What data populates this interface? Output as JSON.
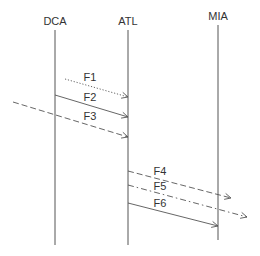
{
  "diagram": {
    "type": "sequence",
    "colors": {
      "line": "#555555",
      "text": "#333333",
      "background": "#ffffff"
    },
    "lifelines": [
      {
        "id": "DCA",
        "label": "DCA",
        "x": 55,
        "label_y": 25,
        "y1": 30,
        "y2": 245
      },
      {
        "id": "ATL",
        "label": "ATL",
        "x": 128,
        "label_y": 25,
        "y1": 30,
        "y2": 245
      },
      {
        "id": "MIA",
        "label": "MIA",
        "x": 218,
        "label_y": 20,
        "y1": 25,
        "y2": 240
      }
    ],
    "messages": [
      {
        "id": "F1",
        "label": "F1",
        "style": "dotted",
        "x1": 65,
        "y1": 79,
        "x2": 128,
        "y2": 97,
        "label_x": 90,
        "label_y": 81
      },
      {
        "id": "F2",
        "label": "F2",
        "style": "solid",
        "x1": 55,
        "y1": 95,
        "x2": 128,
        "y2": 117,
        "label_x": 90,
        "label_y": 101
      },
      {
        "id": "F3",
        "label": "F3",
        "style": "dashed",
        "x1": 13,
        "y1": 102,
        "x2": 128,
        "y2": 137,
        "label_x": 90,
        "label_y": 120
      },
      {
        "id": "F4",
        "label": "F4",
        "style": "dashed",
        "x1": 128,
        "y1": 171,
        "x2": 231,
        "y2": 198,
        "label_x": 160,
        "label_y": 175
      },
      {
        "id": "F5",
        "label": "F5",
        "style": "dashdot",
        "x1": 128,
        "y1": 185,
        "x2": 247,
        "y2": 217,
        "label_x": 160,
        "label_y": 190
      },
      {
        "id": "F6",
        "label": "F6",
        "style": "solid",
        "x1": 128,
        "y1": 203,
        "x2": 218,
        "y2": 226,
        "label_x": 160,
        "label_y": 207
      }
    ]
  }
}
